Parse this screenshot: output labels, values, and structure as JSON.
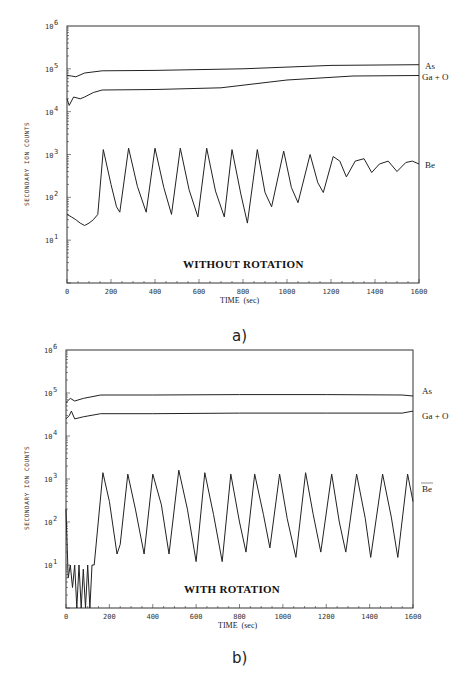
{
  "chart_data": [
    {
      "type": "line",
      "panel": "a)",
      "title": "WITHOUT ROTATION",
      "xlabel": "TIME (sec)",
      "ylabel": "SECONDARY ION COUNTS",
      "xlim": [
        0,
        1600
      ],
      "ylim": [
        1,
        1000000
      ],
      "yscale": "log",
      "xticks": [
        "0",
        "200",
        "400",
        "600",
        "800",
        "1000",
        "1200",
        "1400",
        "1600"
      ],
      "yticks": [
        "10^1",
        "10^2",
        "10^3",
        "10^4",
        "10^5",
        "10^6"
      ],
      "series": [
        {
          "name": "As",
          "x": [
            0,
            20,
            40,
            80,
            160,
            400,
            800,
            1200,
            1600
          ],
          "values": [
            70000,
            68000,
            65000,
            80000,
            90000,
            92000,
            100000,
            120000,
            125000
          ]
        },
        {
          "name": "Ga + O",
          "x": [
            0,
            10,
            30,
            60,
            80,
            120,
            160,
            400,
            700,
            1000,
            1300,
            1600
          ],
          "values": [
            20000,
            14000,
            22000,
            20000,
            22000,
            28000,
            32000,
            33000,
            36000,
            55000,
            68000,
            70000
          ]
        },
        {
          "name": "Be",
          "x": [
            0,
            20,
            40,
            60,
            80,
            100,
            120,
            140,
            165,
            200,
            225,
            240,
            280,
            320,
            360,
            400,
            440,
            475,
            515,
            555,
            595,
            635,
            675,
            715,
            750,
            790,
            820,
            865,
            900,
            930,
            985,
            1020,
            1050,
            1105,
            1140,
            1165,
            1210,
            1240,
            1270,
            1310,
            1350,
            1385,
            1420,
            1460,
            1500,
            1540,
            1570,
            1600
          ],
          "values": [
            40,
            35,
            30,
            25,
            22,
            25,
            30,
            40,
            1300,
            200,
            60,
            45,
            1400,
            180,
            45,
            1400,
            170,
            40,
            1400,
            150,
            35,
            1400,
            140,
            35,
            1300,
            120,
            25,
            1300,
            130,
            60,
            1200,
            170,
            75,
            1000,
            220,
            130,
            900,
            700,
            300,
            700,
            800,
            380,
            600,
            700,
            400,
            650,
            700,
            600
          ]
        }
      ]
    },
    {
      "type": "line",
      "panel": "b)",
      "title": "WITH ROTATION",
      "xlabel": "TIME (sec)",
      "ylabel": "SECONDARY ION COUNTS",
      "xlim": [
        0,
        1600
      ],
      "ylim": [
        1,
        1000000
      ],
      "yscale": "log",
      "xticks": [
        "0",
        "200",
        "400",
        "600",
        "800",
        "1000",
        "1200",
        "1400",
        "1600"
      ],
      "yticks": [
        "10^1",
        "10^2",
        "10^3",
        "10^4",
        "10^5",
        "10^6"
      ],
      "series": [
        {
          "name": "As",
          "x": [
            0,
            20,
            40,
            80,
            160,
            400,
            800,
            1200,
            1550,
            1600
          ],
          "values": [
            60000,
            75000,
            65000,
            75000,
            90000,
            90000,
            92000,
            92000,
            90000,
            85000
          ]
        },
        {
          "name": "Ga + O",
          "x": [
            0,
            15,
            25,
            40,
            80,
            160,
            400,
            800,
            1200,
            1550,
            1600
          ],
          "values": [
            25000,
            30000,
            38000,
            25000,
            28000,
            33000,
            33000,
            34000,
            34000,
            34000,
            38000
          ]
        },
        {
          "name": "Be",
          "x": [
            0,
            10,
            20,
            30,
            40,
            50,
            60,
            70,
            80,
            90,
            100,
            110,
            120,
            130,
            170,
            200,
            235,
            250,
            285,
            320,
            360,
            400,
            440,
            475,
            520,
            560,
            600,
            640,
            680,
            720,
            760,
            800,
            830,
            870,
            910,
            940,
            985,
            1020,
            1060,
            1105,
            1140,
            1175,
            1225,
            1260,
            1290,
            1340,
            1380,
            1405,
            1460,
            1500,
            1530,
            1575,
            1600
          ],
          "values": [
            200,
            5,
            10,
            3,
            10,
            1,
            10,
            1,
            8,
            1,
            10,
            1,
            10,
            10,
            1400,
            300,
            18,
            30,
            1300,
            200,
            18,
            1300,
            250,
            18,
            1600,
            200,
            12,
            1400,
            150,
            12,
            1300,
            100,
            20,
            1300,
            150,
            25,
            1300,
            120,
            15,
            1400,
            150,
            20,
            1300,
            100,
            20,
            1300,
            120,
            15,
            1300,
            130,
            15,
            1300,
            300
          ]
        }
      ]
    }
  ],
  "panel_a": {
    "title": "WITHOUT ROTATION",
    "caption": "a)",
    "xlabel": "TIME  (sec)",
    "ylabel": "SECONDARY ION COUNTS",
    "labels": {
      "as": "As",
      "gao": "Ga + O",
      "be": "Be"
    }
  },
  "panel_b": {
    "title": "WITH ROTATION",
    "caption": "b)",
    "xlabel": "TIME  (sec)",
    "ylabel": "SECONDARY ION COUNTS",
    "labels": {
      "as": "As",
      "gao": "Ga + O",
      "be": "Be"
    }
  },
  "axis": {
    "xticks": [
      "0",
      "200",
      "400",
      "600",
      "800",
      "1000",
      "1200",
      "1400",
      "1600"
    ],
    "ybase": "10",
    "yexp": [
      "6",
      "5",
      "4",
      "3",
      "2",
      "1"
    ]
  }
}
